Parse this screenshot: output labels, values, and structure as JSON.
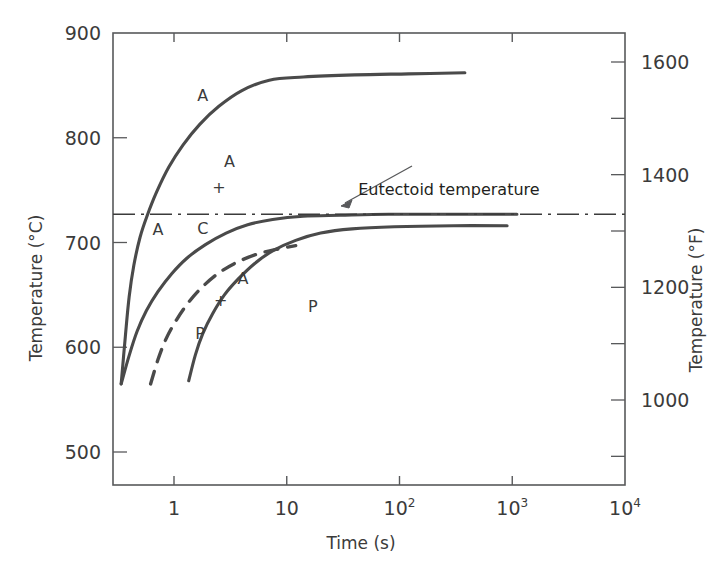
{
  "chart_data": {
    "type": "line",
    "title": "",
    "xlabel": "Time (s)",
    "ylabel_left": "Temperature (°C)",
    "ylabel_right": "Temperature (°F)",
    "xscale": "log",
    "xlim": [
      0.29,
      10000
    ],
    "ylim_left": [
      460,
      900
    ],
    "ylim_right": [
      860,
      1652
    ],
    "grid": false,
    "legend": "none",
    "x_ticks": [
      {
        "value": 1,
        "label": "1"
      },
      {
        "value": 10,
        "label": "10"
      },
      {
        "value": 100,
        "label": "10",
        "sup": "2"
      },
      {
        "value": 1000,
        "label": "10",
        "sup": "3"
      },
      {
        "value": 10000,
        "label": "10",
        "sup": "4"
      }
    ],
    "y_ticks_left": [
      {
        "value": 900,
        "label": "900"
      },
      {
        "value": 800,
        "label": "800"
      },
      {
        "value": 700,
        "label": "700"
      },
      {
        "value": 600,
        "label": "600"
      },
      {
        "value": 500,
        "label": "500"
      }
    ],
    "y_ticks_right": [
      {
        "value": 1600,
        "label": "1600"
      },
      {
        "value": 1500,
        "label": ""
      },
      {
        "value": 1400,
        "label": "1400"
      },
      {
        "value": 1300,
        "label": ""
      },
      {
        "value": 1200,
        "label": "1200"
      },
      {
        "value": 1100,
        "label": ""
      },
      {
        "value": 1000,
        "label": "1000"
      },
      {
        "value": 900,
        "label": ""
      }
    ],
    "eutectoid_temperature_c": 727,
    "annotations": [
      {
        "name": "eutectoid-temperature",
        "text": "Eutectoid temperature",
        "x": 43,
        "y": 745
      },
      {
        "name": "region-austenite-stable",
        "text": "A",
        "x": 1.8,
        "y": 835
      },
      {
        "name": "region-austenite-unstable",
        "text": "A",
        "x": 3.1,
        "y": 772
      },
      {
        "name": "region-plus-upper",
        "text": "+",
        "x": 2.5,
        "y": 747
      },
      {
        "name": "region-austenite-left",
        "text": "A",
        "x": 0.72,
        "y": 707
      },
      {
        "name": "region-coarse-pearlite",
        "text": "C",
        "x": 1.8,
        "y": 708
      },
      {
        "name": "region-austenite-lower",
        "text": "A",
        "x": 4.1,
        "y": 660
      },
      {
        "name": "region-plus-lower",
        "text": "+",
        "x": 2.6,
        "y": 639
      },
      {
        "name": "region-pearlite-left",
        "text": "P",
        "x": 1.7,
        "y": 608
      },
      {
        "name": "region-pearlite-right",
        "text": "P",
        "x": 17,
        "y": 634
      }
    ],
    "series": [
      {
        "name": "austenite-transformation-start-upper",
        "style": "solid",
        "points": [
          [
            0.34,
            565
          ],
          [
            0.37,
            610
          ],
          [
            0.4,
            648
          ],
          [
            0.44,
            678
          ],
          [
            0.5,
            705
          ],
          [
            0.58,
            726
          ],
          [
            0.7,
            748
          ],
          [
            0.9,
            772
          ],
          [
            1.2,
            793
          ],
          [
            1.7,
            813
          ],
          [
            2.5,
            830
          ],
          [
            4.0,
            845
          ],
          [
            7.0,
            855
          ],
          [
            14,
            858
          ],
          [
            40,
            860
          ],
          [
            120,
            861
          ],
          [
            380,
            862
          ]
        ]
      },
      {
        "name": "transformation-start-curve",
        "style": "solid",
        "points": [
          [
            0.34,
            565
          ],
          [
            0.4,
            592
          ],
          [
            0.47,
            615
          ],
          [
            0.57,
            635
          ],
          [
            0.72,
            653
          ],
          [
            0.95,
            670
          ],
          [
            1.3,
            685
          ],
          [
            1.9,
            698
          ],
          [
            2.9,
            709
          ],
          [
            4.5,
            717
          ],
          [
            7.5,
            722
          ],
          [
            14,
            725
          ],
          [
            30,
            726
          ],
          [
            80,
            727
          ],
          [
            300,
            727
          ],
          [
            1100,
            727
          ]
        ]
      },
      {
        "name": "fifty-percent-completion-curve",
        "style": "dashed",
        "points": [
          [
            0.62,
            565
          ],
          [
            0.72,
            588
          ],
          [
            0.85,
            608
          ],
          [
            1.05,
            626
          ],
          [
            1.35,
            643
          ],
          [
            1.8,
            658
          ],
          [
            2.5,
            671
          ],
          [
            3.6,
            681
          ],
          [
            5.5,
            689
          ],
          [
            8.5,
            694
          ],
          [
            12,
            697
          ]
        ]
      },
      {
        "name": "transformation-completion-curve",
        "style": "solid",
        "points": [
          [
            1.35,
            568
          ],
          [
            1.55,
            593
          ],
          [
            1.8,
            613
          ],
          [
            2.2,
            632
          ],
          [
            2.8,
            650
          ],
          [
            3.7,
            665
          ],
          [
            5.2,
            680
          ],
          [
            7.5,
            692
          ],
          [
            12,
            702
          ],
          [
            20,
            709
          ],
          [
            38,
            713
          ],
          [
            90,
            715
          ],
          [
            300,
            716
          ],
          [
            900,
            716
          ]
        ]
      }
    ]
  },
  "figure": {
    "background_color": "#ffffff",
    "line_color": "#3b3b3b",
    "axis_color": "#58595b",
    "text_color": "#3b3b3b"
  }
}
